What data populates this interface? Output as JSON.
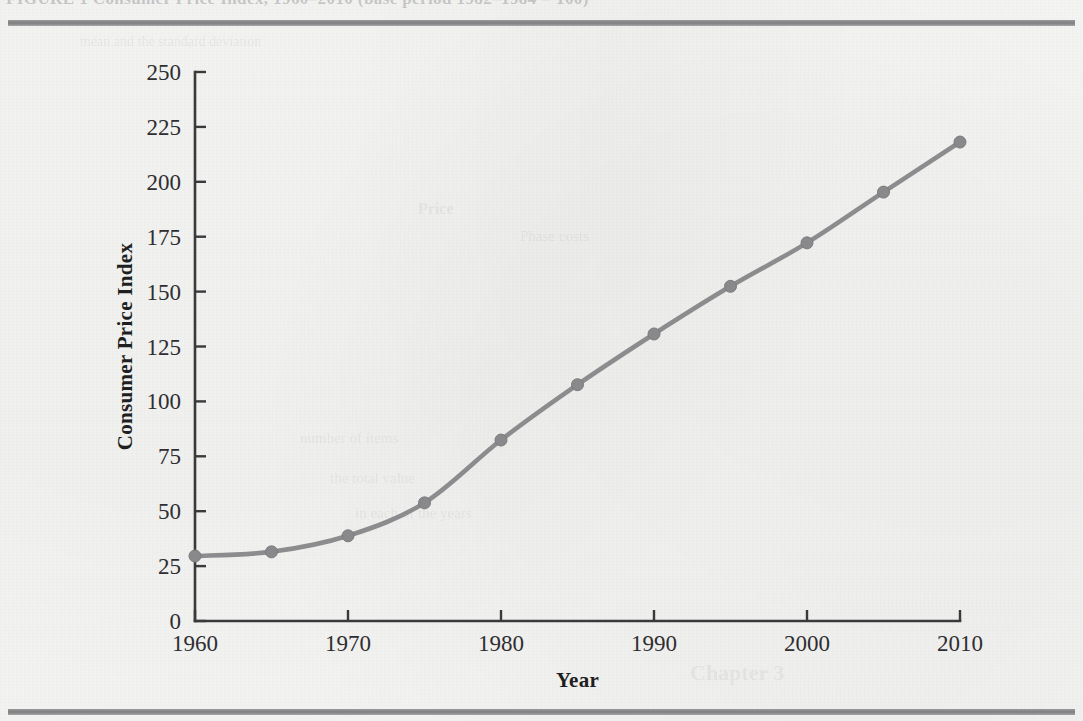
{
  "figure": {
    "caption_cutoff": "FIGURE 1   Consumer Price Index, 1960–2010  (base period 1982–1984 = 100)",
    "rule_color": "#8a8a8d",
    "page_background": "#f5f5f4"
  },
  "chart_data": {
    "type": "line",
    "title": "",
    "xlabel": "Year",
    "ylabel": "Consumer Price Index",
    "xlim": [
      1960,
      2010
    ],
    "ylim": [
      0,
      250
    ],
    "grid": false,
    "legend": "none",
    "line_color": "#8c8c8e",
    "marker_color": "#89898b",
    "marker_shape": "circle",
    "x_ticks": [
      1960,
      1970,
      1980,
      1990,
      2000,
      2010
    ],
    "x_tick_labels": [
      "1960",
      "1970",
      "1980",
      "1990",
      "2000",
      "2010"
    ],
    "y_ticks": [
      0,
      25,
      50,
      75,
      100,
      125,
      150,
      175,
      200,
      225,
      250
    ],
    "y_tick_labels": [
      "0",
      "25",
      "50",
      "75",
      "100",
      "125",
      "150",
      "175",
      "200",
      "225",
      "250"
    ],
    "x": [
      1960,
      1965,
      1970,
      1975,
      1980,
      1985,
      1990,
      1995,
      2000,
      2005,
      2010
    ],
    "values": [
      29.6,
      31.5,
      38.8,
      53.8,
      82.4,
      107.6,
      130.7,
      152.4,
      172.2,
      195.3,
      218.1
    ],
    "series": [
      {
        "name": "Consumer Price Index",
        "values": [
          29.6,
          31.5,
          38.8,
          53.8,
          82.4,
          107.6,
          130.7,
          152.4,
          172.2,
          195.3,
          218.1
        ]
      }
    ],
    "points": [
      {
        "x": 1960,
        "y": 29.6
      },
      {
        "x": 1965,
        "y": 31.5
      },
      {
        "x": 1970,
        "y": 38.8
      },
      {
        "x": 1975,
        "y": 53.8
      },
      {
        "x": 1980,
        "y": 82.4
      },
      {
        "x": 1985,
        "y": 107.6
      },
      {
        "x": 1990,
        "y": 130.7
      },
      {
        "x": 1995,
        "y": 152.4
      },
      {
        "x": 2000,
        "y": 172.2
      },
      {
        "x": 2005,
        "y": 195.3
      },
      {
        "x": 2010,
        "y": 218.1
      }
    ]
  },
  "ghost_text": {
    "lines": [
      {
        "text": "mean and the standard deviation",
        "x": 80,
        "y": 34,
        "size": 14,
        "bold": false
      },
      {
        "text": "Price",
        "x": 418,
        "y": 200,
        "size": 16,
        "bold": true
      },
      {
        "text": "Phase costs",
        "x": 520,
        "y": 228,
        "size": 15,
        "bold": false
      },
      {
        "text": "number of items",
        "x": 300,
        "y": 430,
        "size": 15,
        "bold": false
      },
      {
        "text": "the total value",
        "x": 330,
        "y": 470,
        "size": 15,
        "bold": false
      },
      {
        "text": "in each of the years",
        "x": 355,
        "y": 505,
        "size": 15,
        "bold": false
      },
      {
        "text": "Chapter 3",
        "x": 690,
        "y": 660,
        "size": 22,
        "bold": true
      }
    ]
  }
}
